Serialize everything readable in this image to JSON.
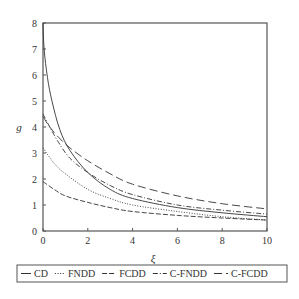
{
  "chart_data": {
    "type": "line",
    "title": "",
    "xlabel": "ξ",
    "ylabel": "g",
    "xlim": [
      0,
      10
    ],
    "ylim": [
      0,
      8
    ],
    "xticks": [
      0,
      2,
      4,
      6,
      8,
      10
    ],
    "yticks": [
      0,
      1,
      2,
      3,
      4,
      5,
      6,
      7,
      8
    ],
    "grid": false,
    "legend_position": "bottom-outside",
    "series": [
      {
        "name": "CD",
        "style": "solid",
        "x": [
          0,
          0.05,
          0.2,
          0.4,
          0.75,
          1.2,
          2,
          3,
          4,
          6,
          8,
          10
        ],
        "values": [
          8.0,
          7.0,
          5.9,
          5.0,
          3.9,
          3.1,
          2.25,
          1.6,
          1.25,
          0.9,
          0.7,
          0.55
        ]
      },
      {
        "name": "FNDD",
        "style": "dotted",
        "x": [
          0,
          0.5,
          1,
          2,
          3,
          4,
          6,
          8,
          10
        ],
        "values": [
          3.2,
          2.6,
          2.2,
          1.6,
          1.25,
          1.0,
          0.75,
          0.55,
          0.42
        ]
      },
      {
        "name": "FCDD",
        "style": "dashed",
        "x": [
          0,
          0.5,
          1,
          2,
          3,
          4,
          6,
          8,
          10
        ],
        "values": [
          1.9,
          1.6,
          1.35,
          1.1,
          0.9,
          0.75,
          0.6,
          0.5,
          0.42
        ]
      },
      {
        "name": "C-FNDD",
        "style": "dash-dot",
        "x": [
          0,
          0.3,
          0.7,
          1.2,
          2,
          3,
          4,
          6,
          8,
          10
        ],
        "values": [
          4.5,
          4.0,
          3.4,
          2.8,
          2.25,
          1.75,
          1.4,
          1.0,
          0.8,
          0.65
        ]
      },
      {
        "name": "C-FCDD",
        "style": "long-dash",
        "x": [
          0,
          0.3,
          0.7,
          1.2,
          2,
          3,
          4,
          6,
          8,
          10
        ],
        "values": [
          4.4,
          4.0,
          3.6,
          3.2,
          2.7,
          2.2,
          1.8,
          1.35,
          1.05,
          0.85
        ]
      }
    ]
  },
  "legend": {
    "items": [
      {
        "label": "CD",
        "style": "solid"
      },
      {
        "label": "FNDD",
        "style": "dotted"
      },
      {
        "label": "FCDD",
        "style": "dashed"
      },
      {
        "label": "C-FNDD",
        "style": "dash-dot"
      },
      {
        "label": "C-FCDD",
        "style": "long-dash"
      }
    ]
  },
  "colors": {
    "line": "#333333",
    "axis": "#555555",
    "background": "#ffffff"
  }
}
